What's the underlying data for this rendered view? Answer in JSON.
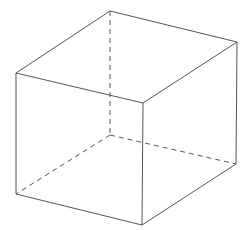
{
  "diagram": {
    "type": "wireframe-cube",
    "stroke_color": "#555555",
    "background": "#ffffff",
    "vertices": {
      "back_top": [
        110,
        11
      ],
      "right_top": [
        237,
        42
      ],
      "left_top": [
        16,
        73
      ],
      "front_top": [
        143,
        103
      ],
      "left_bottom": [
        16,
        194
      ],
      "front_bottom": [
        142,
        225
      ],
      "right_bottom": [
        236,
        164
      ],
      "back_bottom": [
        110,
        135
      ]
    },
    "visible_edges": [
      [
        "back_top",
        "right_top"
      ],
      [
        "back_top",
        "left_top"
      ],
      [
        "left_top",
        "front_top"
      ],
      [
        "right_top",
        "front_top"
      ],
      [
        "left_top",
        "left_bottom"
      ],
      [
        "front_top",
        "front_bottom"
      ],
      [
        "right_top",
        "right_bottom"
      ],
      [
        "left_bottom",
        "front_bottom"
      ],
      [
        "front_bottom",
        "right_bottom"
      ]
    ],
    "hidden_edges": [
      [
        "back_top",
        "back_bottom"
      ],
      [
        "back_bottom",
        "left_bottom"
      ],
      [
        "back_bottom",
        "right_bottom"
      ]
    ]
  }
}
